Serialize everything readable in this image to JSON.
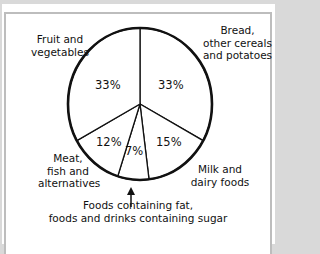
{
  "chart_data": {
    "type": "pie",
    "title": "",
    "start_angle_deg": 0,
    "direction": "clockwise",
    "categories": [
      "Bread, other cereals and potatoes",
      "Milk and dairy foods",
      "Foods containing fat, foods and drinks containing sugar",
      "Meat, fish and alternatives",
      "Fruit and vegetables"
    ],
    "values": [
      33,
      15,
      7,
      12,
      33
    ],
    "unit": "%"
  },
  "labels": {
    "bread": "Bread,\nother cereals\nand potatoes",
    "milk": "Milk and\ndairy foods",
    "fats": "Foods containing fat,\nfoods and drinks containing sugar",
    "meat": "Meat,\nfish and\nalternatives",
    "fruit": "Fruit and\nvegetables"
  },
  "percentages": {
    "bread": "33%",
    "milk": "15%",
    "fats": "7%",
    "meat": "12%",
    "fruit": "33%"
  },
  "colors": {
    "background": "#d9d9d9",
    "panel_border": "#bdbdbd",
    "slice_fill": "#ffffff",
    "outline": "#111111"
  }
}
